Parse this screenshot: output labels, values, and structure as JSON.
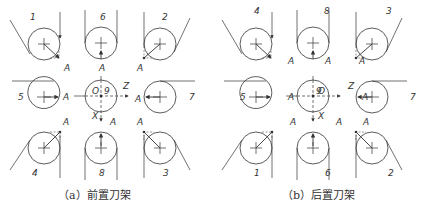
{
  "figure": {
    "panels": [
      {
        "id": "a",
        "caption": "（a）前置刀架",
        "origin_x": 0,
        "cells": {
          "top_left": "1",
          "top_mid": "6",
          "top_right": "2",
          "mid_left": "5",
          "center": "9",
          "mid_right": "7",
          "bot_left": "4",
          "bot_mid": "8",
          "bot_right": "3"
        }
      },
      {
        "id": "b",
        "caption": "（b）后置刀架",
        "origin_x": 212,
        "cells": {
          "top_left": "4",
          "top_mid": "8",
          "top_right": "3",
          "mid_left": "5",
          "center": "9",
          "mid_right": "7",
          "bot_left": "1",
          "bot_mid": "6",
          "bot_right": "2"
        }
      }
    ],
    "point_label": "A",
    "origin_label": "O",
    "axis_z_label": "Z",
    "axis_x_label": "X",
    "line_color": "#333333"
  }
}
